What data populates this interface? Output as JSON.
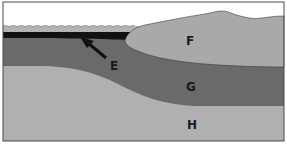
{
  "diagram": {
    "type": "geological cross-section",
    "labels": {
      "E": "E",
      "F": "F",
      "G": "G",
      "H": "H"
    },
    "layers": [
      {
        "id": "water",
        "description": "thin light band at surface on left",
        "color": "#b4b4b4"
      },
      {
        "id": "E",
        "description": "thin black layer beneath water, indicated by arrow",
        "color": "#111111"
      },
      {
        "id": "F",
        "description": "light grey mound on right rising above water level",
        "color": "#a9a9a9"
      },
      {
        "id": "G",
        "description": "dark grey band",
        "color": "#6a6a6a"
      },
      {
        "id": "H",
        "description": "light grey bottom layer",
        "color": "#b0b0b0"
      }
    ],
    "colors": {
      "sky": "#ffffff",
      "frame": "#4a4a4a",
      "water": "#b4b4b4",
      "black_layer": "#111111",
      "layer_F": "#a9a9a9",
      "layer_G": "#6a6a6a",
      "layer_H": "#b0b0b0",
      "arrow": "#111111"
    }
  }
}
